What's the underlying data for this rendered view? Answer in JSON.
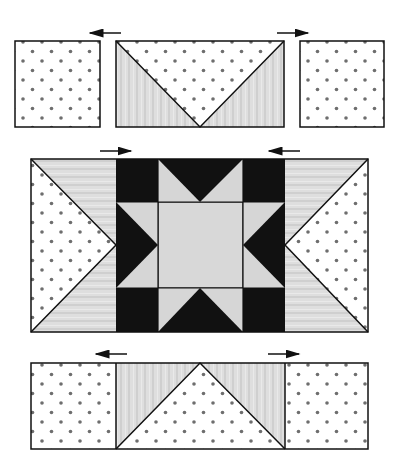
{
  "diagram": {
    "type": "quilt-block-assembly",
    "colors": {
      "dot_fabric_bg": "#ffffff",
      "dot_color": "#6e6e6e",
      "grey_fabric": "#dcdcdc",
      "grey_stripe": "#cfcfcf",
      "dark_fabric": "#111111",
      "light_center": "#d6d6d6",
      "outline": "#111111"
    },
    "rows": [
      {
        "name": "top-row",
        "units": [
          "dot-square",
          "flying-geese-inverted",
          "dot-square"
        ],
        "arrows": [
          "left",
          "right"
        ]
      },
      {
        "name": "middle-row",
        "units": [
          "side-hst-left",
          "sawtooth-star",
          "side-hst-right"
        ],
        "arrows": [
          "right",
          "left"
        ]
      },
      {
        "name": "bottom-row",
        "units": [
          "dot-square",
          "flying-geese",
          "dot-square"
        ],
        "arrows": [
          "left",
          "right"
        ]
      }
    ]
  }
}
